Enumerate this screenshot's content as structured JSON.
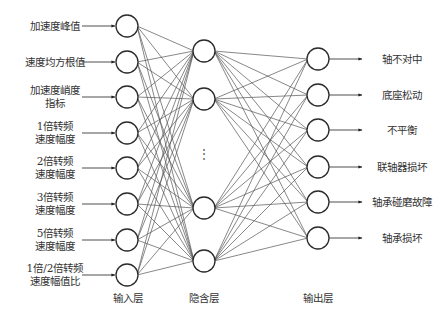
{
  "diagram": {
    "type": "neural-network",
    "input_layer": {
      "label": "输入层",
      "nodes": [
        {
          "label": "加速度峰值",
          "lines": [
            "加速度峰值"
          ]
        },
        {
          "label": "速度均方根值",
          "lines": [
            "速度均方根值"
          ]
        },
        {
          "label": "加速度峭度指标",
          "lines": [
            "加速度峭度",
            "指标"
          ]
        },
        {
          "label": "1倍转频速度幅度",
          "lines": [
            "1倍转频",
            "速度幅度"
          ]
        },
        {
          "label": "2倍转频速度幅度",
          "lines": [
            "2倍转频",
            "速度幅度"
          ]
        },
        {
          "label": "3倍转频速度幅度",
          "lines": [
            "3倍转频",
            "速度幅度"
          ]
        },
        {
          "label": "5倍转频速度幅度",
          "lines": [
            "5倍转频",
            "速度幅度"
          ]
        },
        {
          "label": "1倍/2倍转频速度幅值比",
          "lines": [
            "1倍/2倍转频",
            "速度幅值比"
          ]
        }
      ]
    },
    "hidden_layer": {
      "label": "隐含层",
      "visible_nodes": 4,
      "ellipsis": "⋮"
    },
    "output_layer": {
      "label": "输出层",
      "nodes": [
        "轴不对中",
        "底座松动",
        "不平衡",
        "联轴器损坏",
        "轴承碰磨故障",
        "轴承损坏"
      ]
    },
    "colors": {
      "node_stroke": "#2b2b2b",
      "edge": "#555555",
      "text": "#333333",
      "background": "#ffffff"
    }
  }
}
